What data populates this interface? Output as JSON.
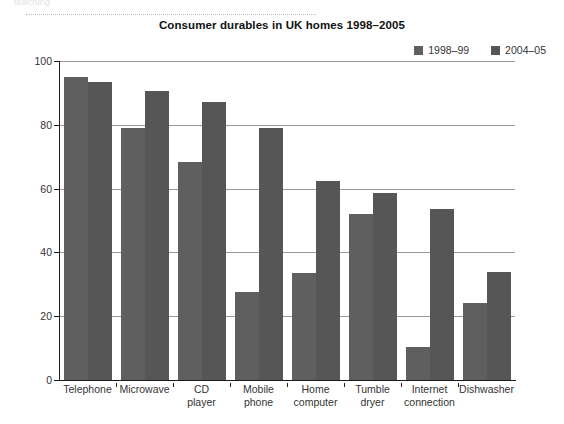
{
  "page": {
    "cut_header_text": "teaching",
    "title": "Consumer durables in UK homes 1998–2005"
  },
  "legend": {
    "position": "top-right",
    "items": [
      {
        "label": "1998–99",
        "color": "#5f5f5f"
      },
      {
        "label": "2004–05",
        "color": "#565656"
      }
    ]
  },
  "axes": {
    "ylabel": "Percentages",
    "yticks": [
      "0",
      "20",
      "40",
      "60",
      "80",
      "100"
    ],
    "ymin": 0,
    "ymax": 100
  },
  "chart_data": {
    "type": "bar",
    "title": "Consumer durables in UK homes 1998–2005",
    "xlabel": "",
    "ylabel": "Percentages",
    "ylim": [
      0,
      100
    ],
    "ytick_step": 20,
    "grid": true,
    "legend_position": "top-right",
    "categories": [
      "Telephone",
      "Microwave",
      "CD player",
      "Mobile phone",
      "Home computer",
      "Tumble dryer",
      "Internet connection",
      "Dishwasher"
    ],
    "category_lines": [
      [
        "Telephone"
      ],
      [
        "Microwave"
      ],
      [
        "CD",
        "player"
      ],
      [
        "Mobile",
        "phone"
      ],
      [
        "Home",
        "computer"
      ],
      [
        "Tumble",
        "dryer"
      ],
      [
        "Internet",
        "connection"
      ],
      [
        "Dishwasher"
      ]
    ],
    "series": [
      {
        "name": "1998–99",
        "color": "#5f5f5f",
        "values": [
          95,
          79,
          68.5,
          27.5,
          33.5,
          52,
          10.5,
          24
        ]
      },
      {
        "name": "2004–05",
        "color": "#565656",
        "values": [
          93.5,
          90.5,
          87,
          79,
          62.5,
          58.5,
          53.5,
          34
        ]
      }
    ]
  }
}
